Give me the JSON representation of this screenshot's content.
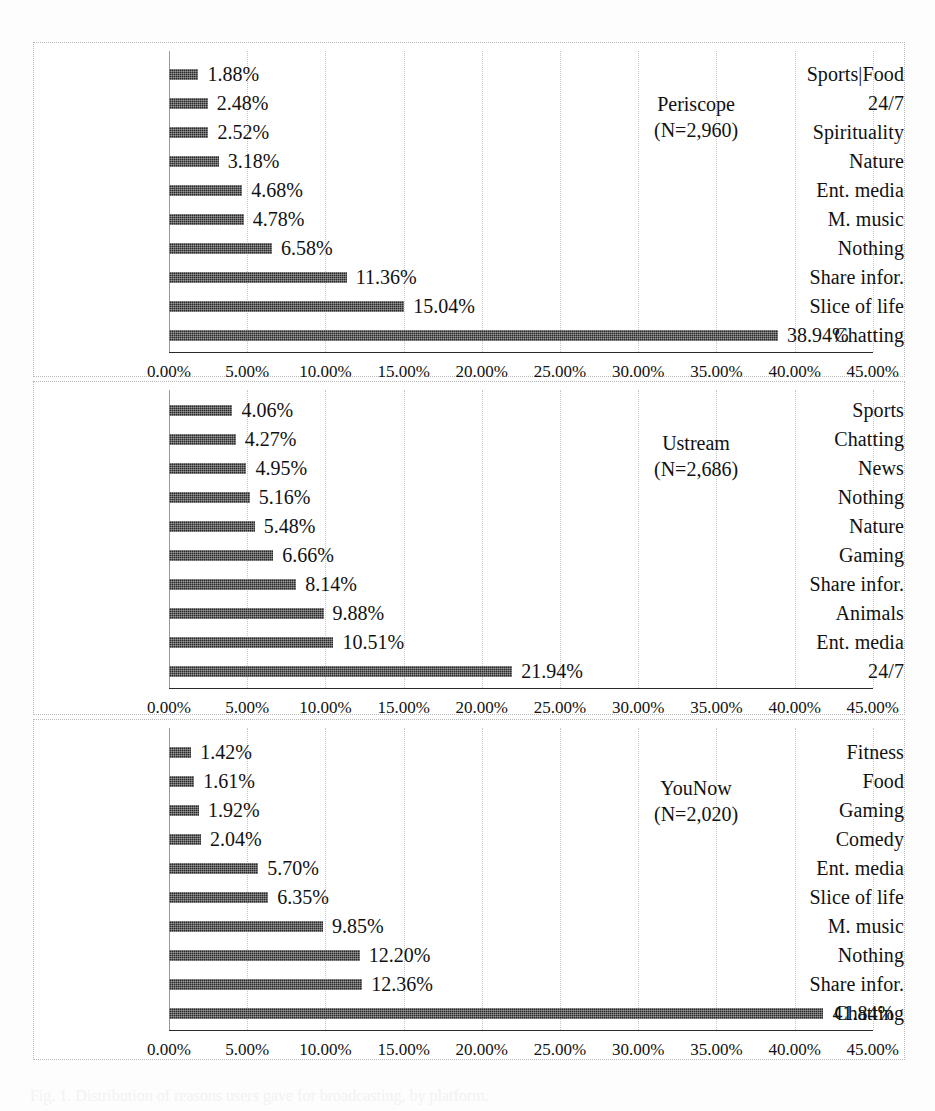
{
  "figure": {
    "axis": {
      "min": 0,
      "max": 45,
      "step": 5,
      "ticks": [
        "0.00%",
        "5.00%",
        "10.00%",
        "15.00%",
        "20.00%",
        "25.00%",
        "30.00%",
        "35.00%",
        "40.00%",
        "45.00%"
      ]
    },
    "bar_color": "#2a2a2a",
    "grid_color": "#c6c6c6",
    "caption": "Fig. 1. Distribution of reasons users gave for broadcasting, by platform."
  },
  "chart_data": [
    {
      "type": "bar",
      "orientation": "horizontal",
      "title": "Periscope",
      "subtitle": "(N=2,960)",
      "n": 2960,
      "xlabel": "",
      "ylabel": "",
      "xlim": [
        0,
        45
      ],
      "grid": true,
      "legend": "none",
      "categories": [
        "Sports|Food",
        "24/7",
        "Spirituality",
        "Nature",
        "Ent. media",
        "M. music",
        "Nothing",
        "Share infor.",
        "Slice of life",
        "Chatting"
      ],
      "values": [
        1.88,
        2.48,
        2.52,
        3.18,
        4.68,
        4.78,
        6.58,
        11.36,
        15.04,
        38.94
      ],
      "labels": [
        "1.88%",
        "2.48%",
        "2.52%",
        "3.18%",
        "4.68%",
        "4.78%",
        "6.58%",
        "11.36%",
        "15.04%",
        "38.94%"
      ]
    },
    {
      "type": "bar",
      "orientation": "horizontal",
      "title": "Ustream",
      "subtitle": "(N=2,686)",
      "n": 2686,
      "xlabel": "",
      "ylabel": "",
      "xlim": [
        0,
        45
      ],
      "grid": true,
      "legend": "none",
      "categories": [
        "Sports",
        "Chatting",
        "News",
        "Nothing",
        "Nature",
        "Gaming",
        "Share infor.",
        "Animals",
        "Ent. media",
        "24/7"
      ],
      "values": [
        4.06,
        4.27,
        4.95,
        5.16,
        5.48,
        6.66,
        8.14,
        9.88,
        10.51,
        21.94
      ],
      "labels": [
        "4.06%",
        "4.27%",
        "4.95%",
        "5.16%",
        "5.48%",
        "6.66%",
        "8.14%",
        "9.88%",
        "10.51%",
        "21.94%"
      ]
    },
    {
      "type": "bar",
      "orientation": "horizontal",
      "title": "YouNow",
      "subtitle": "(N=2,020)",
      "n": 2020,
      "xlabel": "",
      "ylabel": "",
      "xlim": [
        0,
        45
      ],
      "grid": true,
      "legend": "none",
      "categories": [
        "Fitness",
        "Food",
        "Gaming",
        "Comedy",
        "Ent. media",
        "Slice of life",
        "M. music",
        "Nothing",
        "Share infor.",
        "Chatting"
      ],
      "values": [
        1.42,
        1.61,
        1.92,
        2.04,
        5.7,
        6.35,
        9.85,
        12.2,
        12.36,
        41.84
      ],
      "labels": [
        "1.42%",
        "1.61%",
        "1.92%",
        "2.04%",
        "5.70%",
        "6.35%",
        "9.85%",
        "12.20%",
        "12.36%",
        "41.84%"
      ]
    }
  ]
}
